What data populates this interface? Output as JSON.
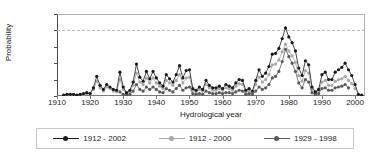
{
  "chart_data": {
    "type": "line",
    "title": "",
    "xlabel": "Hydrological year",
    "ylabel": "Probability",
    "xlim": [
      1910,
      2003
    ],
    "ylim": [
      0.0,
      1.0
    ],
    "grid": false,
    "reference_line": {
      "y": 0.8,
      "style": "dashed",
      "color": "#b4b4b4"
    },
    "legend_position": "bottom",
    "ytick_labels": [
      "1.0",
      "0.8",
      "0.6",
      "0.4",
      "0.2",
      "0.0"
    ],
    "ytick_values": [
      1.0,
      0.8,
      0.6,
      0.4,
      0.2,
      0.0
    ],
    "xtick_labels": [
      "1910",
      "1920",
      "1930",
      "1940",
      "1950",
      "1960",
      "1970",
      "1980",
      "1990",
      "2000"
    ],
    "xtick_values": [
      1910,
      1920,
      1930,
      1940,
      1950,
      1960,
      1970,
      1980,
      1990,
      2000
    ],
    "series": [
      {
        "name": "1912 - 2002",
        "color": "#1a1a1a",
        "x": [
          1912,
          1913,
          1914,
          1915,
          1916,
          1917,
          1918,
          1919,
          1920,
          1921,
          1922,
          1923,
          1924,
          1925,
          1926,
          1927,
          1928,
          1929,
          1930,
          1931,
          1932,
          1933,
          1934,
          1935,
          1936,
          1937,
          1938,
          1939,
          1940,
          1941,
          1942,
          1943,
          1944,
          1945,
          1946,
          1947,
          1948,
          1949,
          1950,
          1951,
          1952,
          1953,
          1954,
          1955,
          1956,
          1957,
          1958,
          1959,
          1960,
          1961,
          1962,
          1963,
          1964,
          1965,
          1966,
          1967,
          1968,
          1969,
          1970,
          1971,
          1972,
          1973,
          1974,
          1975,
          1976,
          1977,
          1978,
          1979,
          1980,
          1981,
          1982,
          1983,
          1984,
          1985,
          1986,
          1987,
          1988,
          1989,
          1990,
          1991,
          1992,
          1993,
          1994,
          1995,
          1996,
          1997,
          1998,
          1999,
          2000,
          2001,
          2002
        ],
        "values": [
          0.01,
          0.02,
          0.02,
          0.02,
          0.01,
          0.02,
          0.03,
          0.04,
          0.03,
          0.1,
          0.24,
          0.13,
          0.08,
          0.14,
          0.11,
          0.08,
          0.07,
          0.29,
          0.11,
          0.04,
          0.07,
          0.17,
          0.39,
          0.23,
          0.18,
          0.3,
          0.21,
          0.3,
          0.22,
          0.16,
          0.12,
          0.26,
          0.21,
          0.17,
          0.26,
          0.37,
          0.22,
          0.31,
          0.32,
          0.09,
          0.07,
          0.11,
          0.08,
          0.19,
          0.13,
          0.1,
          0.1,
          0.12,
          0.09,
          0.14,
          0.12,
          0.1,
          0.16,
          0.2,
          0.19,
          0.07,
          0.09,
          0.06,
          0.19,
          0.32,
          0.24,
          0.28,
          0.36,
          0.51,
          0.52,
          0.58,
          0.7,
          0.83,
          0.72,
          0.65,
          0.55,
          0.34,
          0.25,
          0.43,
          0.38,
          0.11,
          0.05,
          0.08,
          0.26,
          0.29,
          0.2,
          0.2,
          0.29,
          0.32,
          0.35,
          0.4,
          0.32,
          0.25,
          0.14,
          0.02,
          0.01
        ]
      },
      {
        "name": "1912 - 2000",
        "color": "#a8a8a8",
        "x": [
          1912,
          1913,
          1914,
          1915,
          1916,
          1917,
          1918,
          1919,
          1920,
          1921,
          1922,
          1923,
          1924,
          1925,
          1926,
          1927,
          1928,
          1929,
          1930,
          1931,
          1932,
          1933,
          1934,
          1935,
          1936,
          1937,
          1938,
          1939,
          1940,
          1941,
          1942,
          1943,
          1944,
          1945,
          1946,
          1947,
          1948,
          1949,
          1950,
          1951,
          1952,
          1953,
          1954,
          1955,
          1956,
          1957,
          1958,
          1959,
          1960,
          1961,
          1962,
          1963,
          1964,
          1965,
          1966,
          1967,
          1968,
          1969,
          1970,
          1971,
          1972,
          1973,
          1974,
          1975,
          1976,
          1977,
          1978,
          1979,
          1980,
          1981,
          1982,
          1983,
          1984,
          1985,
          1986,
          1987,
          1988,
          1989,
          1990,
          1991,
          1992,
          1993,
          1994,
          1995,
          1996,
          1997,
          1998,
          1999,
          2000
        ],
        "values": [
          0.01,
          0.02,
          0.02,
          0.02,
          0.01,
          0.02,
          0.02,
          0.03,
          0.03,
          0.08,
          0.18,
          0.1,
          0.06,
          0.11,
          0.09,
          0.06,
          0.05,
          0.2,
          0.08,
          0.03,
          0.05,
          0.13,
          0.28,
          0.17,
          0.14,
          0.22,
          0.16,
          0.22,
          0.16,
          0.12,
          0.09,
          0.19,
          0.16,
          0.13,
          0.19,
          0.26,
          0.16,
          0.22,
          0.23,
          0.07,
          0.05,
          0.08,
          0.06,
          0.14,
          0.1,
          0.07,
          0.07,
          0.09,
          0.07,
          0.1,
          0.09,
          0.07,
          0.12,
          0.15,
          0.14,
          0.05,
          0.06,
          0.04,
          0.14,
          0.23,
          0.17,
          0.2,
          0.26,
          0.38,
          0.39,
          0.44,
          0.54,
          0.63,
          0.55,
          0.49,
          0.41,
          0.25,
          0.18,
          0.31,
          0.28,
          0.08,
          0.04,
          0.06,
          0.17,
          0.19,
          0.13,
          0.13,
          0.18,
          0.2,
          0.21,
          0.24,
          0.19,
          0.15,
          0.09
        ]
      },
      {
        "name": "1929 - 1998",
        "color": "#5a5a5a",
        "x": [
          1929,
          1930,
          1931,
          1932,
          1933,
          1934,
          1935,
          1936,
          1937,
          1938,
          1939,
          1940,
          1941,
          1942,
          1943,
          1944,
          1945,
          1946,
          1947,
          1948,
          1949,
          1950,
          1951,
          1952,
          1953,
          1954,
          1955,
          1956,
          1957,
          1958,
          1959,
          1960,
          1961,
          1962,
          1963,
          1964,
          1965,
          1966,
          1967,
          1968,
          1969,
          1970,
          1971,
          1972,
          1973,
          1974,
          1975,
          1976,
          1977,
          1978,
          1979,
          1980,
          1981,
          1982,
          1983,
          1984,
          1985,
          1986,
          1987,
          1988,
          1989,
          1990,
          1991,
          1992,
          1993,
          1994,
          1995,
          1996,
          1997,
          1998
        ],
        "values": [
          0.05,
          0.02,
          0.01,
          0.02,
          0.06,
          0.14,
          0.08,
          0.06,
          0.11,
          0.08,
          0.11,
          0.08,
          0.05,
          0.04,
          0.09,
          0.07,
          0.05,
          0.09,
          0.13,
          0.07,
          0.1,
          0.11,
          0.03,
          0.02,
          0.03,
          0.02,
          0.06,
          0.04,
          0.03,
          0.03,
          0.04,
          0.03,
          0.04,
          0.04,
          0.03,
          0.05,
          0.07,
          0.06,
          0.02,
          0.03,
          0.02,
          0.06,
          0.11,
          0.08,
          0.1,
          0.14,
          0.22,
          0.24,
          0.3,
          0.42,
          0.57,
          0.48,
          0.4,
          0.3,
          0.16,
          0.1,
          0.2,
          0.17,
          0.04,
          0.02,
          0.03,
          0.09,
          0.1,
          0.07,
          0.07,
          0.1,
          0.11,
          0.12,
          0.14,
          0.1
        ]
      }
    ]
  }
}
